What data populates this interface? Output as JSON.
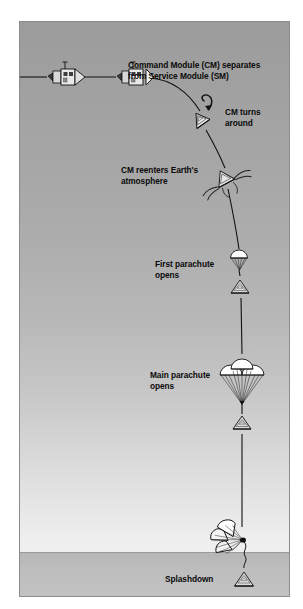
{
  "diagram": {
    "colors": {
      "sky_top": "#9c9c9c",
      "sky_bottom": "#f3f3f3",
      "ocean": "#bdbdbd",
      "frame_border": "#8c8c8c",
      "ink": "#0a0a0a",
      "canopy_fill": "#ffffff"
    },
    "labels": {
      "separation": "Command Module (CM) separates\nfrom Service Module (SM)",
      "turn_around": "CM turns around",
      "reentry": "CM reenters Earth's\natmosphere",
      "first_parachute": "First parachute\nopens",
      "main_parachute": "Main parachute\nopens",
      "splashdown": "Splashdown"
    },
    "stages": [
      {
        "name": "spacecraft-cruise",
        "icon": "csm-spacecraft-icon"
      },
      {
        "name": "spacecraft-separation",
        "icon": "csm-separating-icon"
      },
      {
        "name": "capsule-turn-around",
        "icon": "capsule-rotation-arrow-icon"
      },
      {
        "name": "capsule-reentry",
        "icon": "capsule-reentry-flames-icon"
      },
      {
        "name": "drogue-parachute",
        "icon": "single-parachute-icon"
      },
      {
        "name": "main-parachute",
        "icon": "triple-parachute-icon"
      },
      {
        "name": "splashdown-capsule",
        "icon": "collapsed-parachute-icon"
      }
    ]
  }
}
